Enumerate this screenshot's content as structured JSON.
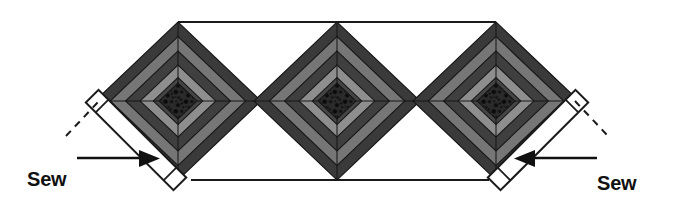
{
  "diagram": {
    "title": "Sew first",
    "kind": "quilt-assembly-diagram",
    "background_color": "#ffffff",
    "outline_color": "#1a1a1a",
    "blocks": {
      "count": 3,
      "shape": "diamond",
      "pattern": "courthouse-steps-log-cabin",
      "centers_x": [
        178,
        337,
        496
      ],
      "center_y": 101,
      "half_width": 83,
      "half_height": 79,
      "rings": [
        {
          "index": 0,
          "name": "outer-dark-ring",
          "color": "#3a3a3a"
        },
        {
          "index": 1,
          "name": "medium-gray-ring",
          "color": "#767676"
        },
        {
          "index": 2,
          "name": "dark-ring",
          "color": "#3f3f3f"
        },
        {
          "index": 3,
          "name": "light-gray-ring",
          "color": "#8e8e8e"
        },
        {
          "index": 4,
          "name": "inner-dark-ring",
          "color": "#454545"
        },
        {
          "index": 5,
          "name": "textured-center-square",
          "color": "#2b2b2b"
        }
      ]
    },
    "edge_lines": {
      "top_line": {
        "x1": 178,
        "y1": 22,
        "x2": 496,
        "y2": 22
      },
      "bottom_line": {
        "x1": 190,
        "y1": 180,
        "x2": 490,
        "y2": 180
      }
    },
    "binding_strips": [
      {
        "name": "left-binding-strip",
        "position": "left",
        "fill": "#ffffff",
        "stroke": "#1a1a1a",
        "angle_deg": 45
      },
      {
        "name": "right-binding-strip",
        "position": "right",
        "fill": "#ffffff",
        "stroke": "#1a1a1a",
        "angle_deg": -45
      }
    ],
    "annotations": [
      {
        "name": "sew-first-left",
        "line1": "Sew",
        "line2": "first",
        "arrow_direction": "right",
        "has_dashed_leader": true
      },
      {
        "name": "sew-first-right",
        "line1": "Sew",
        "line2": "first",
        "arrow_direction": "left",
        "has_dashed_leader": true
      }
    ]
  }
}
